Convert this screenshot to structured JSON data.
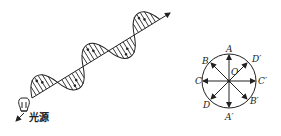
{
  "left_figure": {
    "description": "polarized-free light wave propagating from a light source",
    "source_label": "光源"
  },
  "right_figure": {
    "description": "vibration directions of natural light viewed along propagation",
    "center_label": "O",
    "labels": {
      "A": "A",
      "A_prime": "A′",
      "B": "B",
      "B_prime": "B′",
      "C": "C",
      "C_prime": "C′",
      "D": "D",
      "D_prime": "D′"
    }
  }
}
